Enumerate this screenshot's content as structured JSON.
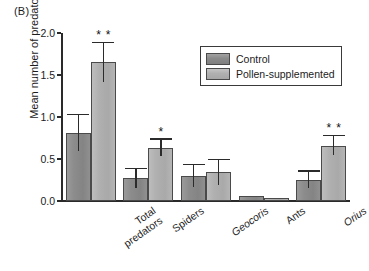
{
  "panel_label": "(B)",
  "chart_data": {
    "type": "bar",
    "title": "",
    "xlabel": "",
    "ylabel": "Mean number of predators",
    "ylim": [
      0.0,
      2.0
    ],
    "yticks": [
      "0.0",
      "0.5",
      "1.0",
      "1.5",
      "2.0"
    ],
    "ytick_values": [
      0.0,
      0.5,
      1.0,
      1.5,
      2.0
    ],
    "grid": false,
    "legend_position": "upper right",
    "categories": [
      "Total predators",
      "Spiders",
      "Geocoris",
      "Ants",
      "Orius"
    ],
    "categories_italic": [
      false,
      false,
      true,
      false,
      true
    ],
    "series": [
      {
        "name": "Control",
        "color": "#8c8c8c",
        "values": [
          0.81,
          0.27,
          0.3,
          0.06,
          0.25
        ],
        "errors": [
          0.21,
          0.11,
          0.13,
          0.0,
          0.1
        ]
      },
      {
        "name": "Pollen-supplemented",
        "color": "#b0b0b0",
        "values": [
          1.65,
          0.63,
          0.34,
          0.04,
          0.66
        ],
        "errors": [
          0.23,
          0.1,
          0.15,
          0.0,
          0.11
        ]
      }
    ],
    "significance": [
      {
        "category": "Total predators",
        "series": "Pollen-supplemented",
        "marker": "**"
      },
      {
        "category": "Spiders",
        "series": "Pollen-supplemented",
        "marker": "*"
      },
      {
        "category": "Orius",
        "series": "Pollen-supplemented",
        "marker": "**"
      }
    ]
  },
  "legend": {
    "items": [
      {
        "label": "Control"
      },
      {
        "label": "Pollen-supplemented"
      }
    ]
  }
}
